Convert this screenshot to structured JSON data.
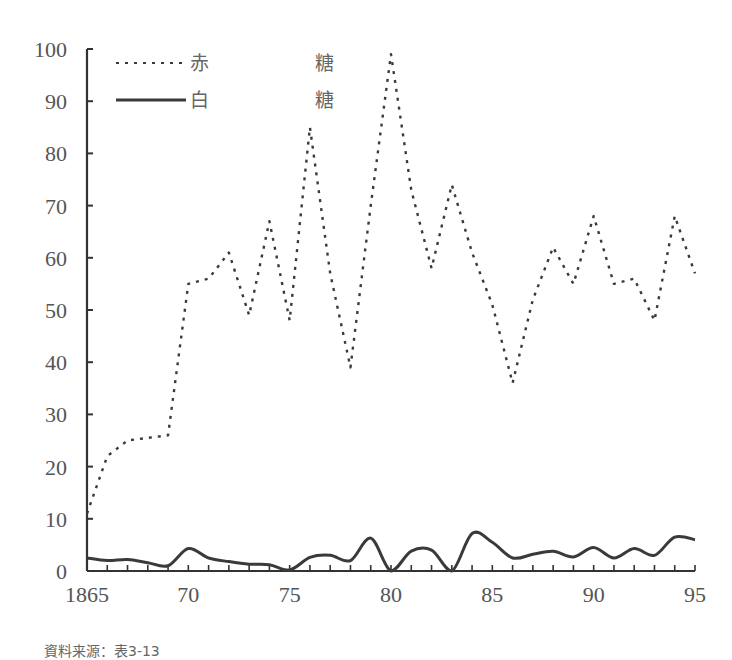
{
  "chart_data": {
    "type": "line",
    "title": "",
    "xlabel": "",
    "ylabel": "",
    "ylim": [
      0,
      100
    ],
    "xlim": [
      1865,
      1895
    ],
    "grid": false,
    "legend_position": "top-left",
    "x_tick_labels": [
      "1865",
      "70",
      "75",
      "80",
      "85",
      "90",
      "95"
    ],
    "x_tick_values": [
      1865,
      1870,
      1875,
      1880,
      1885,
      1890,
      1895
    ],
    "y_tick_labels": [
      "0",
      "10",
      "20",
      "30",
      "40",
      "50",
      "60",
      "70",
      "80",
      "90",
      "100"
    ],
    "x": [
      1865,
      1866,
      1867,
      1868,
      1869,
      1870,
      1871,
      1872,
      1873,
      1874,
      1875,
      1876,
      1877,
      1878,
      1879,
      1880,
      1881,
      1882,
      1883,
      1884,
      1885,
      1886,
      1887,
      1888,
      1889,
      1890,
      1891,
      1892,
      1893,
      1894,
      1895
    ],
    "series": [
      {
        "name": "赤　　　糖",
        "style": "dotted",
        "values": [
          11,
          22,
          25,
          25.5,
          26,
          55,
          56,
          61,
          49,
          67,
          48,
          85,
          57,
          39,
          70,
          99,
          73,
          58,
          74,
          61,
          51,
          36,
          52,
          62,
          55,
          68,
          55,
          56,
          48,
          68,
          57
        ]
      },
      {
        "name": "白　　　糖",
        "style": "solid",
        "values": [
          2.5,
          2,
          2.2,
          1.6,
          1,
          4.3,
          2.5,
          1.8,
          1.3,
          1.2,
          0.2,
          2.6,
          3,
          2,
          6.3,
          0,
          3.8,
          4,
          0,
          7.2,
          5.5,
          2.5,
          3.2,
          3.8,
          2.7,
          4.5,
          2.5,
          4.3,
          3,
          6.5,
          6
        ]
      }
    ]
  },
  "legend": {
    "items": [
      {
        "label_left": "赤",
        "label_right": "糖",
        "style": "dotted"
      },
      {
        "label_left": "白",
        "label_right": "糖",
        "style": "solid"
      }
    ]
  },
  "source_note": "資料来源：表3-13",
  "colors": {
    "line": "#3a3a3a",
    "axis": "#333333",
    "text": "#555555"
  }
}
